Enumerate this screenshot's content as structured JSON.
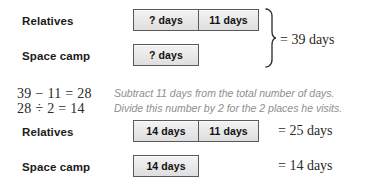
{
  "diagram": {
    "title_rows": {
      "relatives": "Relatives",
      "space_camp": "Space camp"
    },
    "top_group": {
      "relatives_bar": {
        "segment_unknown": "? days",
        "segment_known": "11 days"
      },
      "space_camp_bar": {
        "segment_unknown": "? days"
      },
      "brace_result": "= 39 days"
    },
    "work": {
      "equation_line1": "39 − 11 = 28",
      "equation_line2": "28 ÷ 2 = 14",
      "explanation_line1": "Subtract 11 days from the total number of days.",
      "explanation_line2": "Divide this number by 2 for the 2 places he visits."
    },
    "bottom_group": {
      "relatives_bar": {
        "segment_solved": "14 days",
        "segment_known": "11 days"
      },
      "relatives_result": "= 25 days",
      "space_camp_bar": {
        "segment_solved": "14 days"
      },
      "space_camp_result": "= 14 days"
    }
  },
  "colors": {
    "bar_border": "#595959",
    "bar_fill": "#eaeaea",
    "text_primary": "#1b1b1b",
    "text_serif": "#2a2a2a",
    "text_explanation": "#8e8e8e",
    "background": "#ffffff"
  }
}
